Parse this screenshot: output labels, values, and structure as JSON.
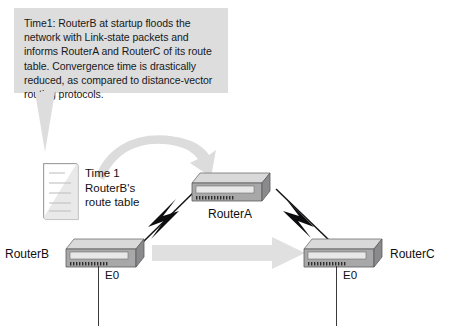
{
  "callout": {
    "text": "Time1: RouterB at startup floods the network with Link-state packets and informs RouterA and RouterC of its route table. Convergence time is drastically reduced, as compared to distance-vector routing protocols.",
    "background_color": "#dddddd",
    "text_color": "#18181a"
  },
  "route_table": {
    "caption": "Time 1\nRouterB's\nroute table",
    "icon": "document-stack-icon"
  },
  "devices": [
    {
      "id": "routerA",
      "label": "RouterA",
      "icon": "router-icon"
    },
    {
      "id": "routerB",
      "label": "RouterB",
      "icon": "router-icon"
    },
    {
      "id": "routerC",
      "label": "RouterC",
      "icon": "router-icon"
    }
  ],
  "interfaces": [
    {
      "id": "e0-b",
      "label": "E0",
      "device": "RouterB"
    },
    {
      "id": "e0-c",
      "label": "E0",
      "device": "RouterC"
    }
  ],
  "links": [
    {
      "from": "RouterB",
      "to": "RouterA",
      "symbol": "lightning-bolt-icon"
    },
    {
      "from": "RouterA",
      "to": "RouterC",
      "symbol": "lightning-bolt-icon"
    }
  ],
  "flow_arrows": [
    {
      "id": "flood-arrow-to-routerA",
      "style": "curved",
      "color": "#d9d9d9"
    },
    {
      "id": "flood-arrow-to-routerC",
      "style": "straight",
      "color": "#e2e2e2"
    }
  ],
  "colors": {
    "callout_fill": "#dddddd",
    "arrow_fill": "#dcdcdc",
    "router_top": "#d6d6d6",
    "router_front": "#9a9a9a",
    "line": "#3a3a3c"
  }
}
